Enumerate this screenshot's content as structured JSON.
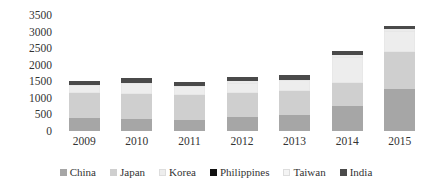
{
  "chart_data": {
    "type": "bar",
    "stacked": true,
    "title": "",
    "subtitle": "",
    "xlabel": "",
    "ylabel": "",
    "categories": [
      "2009",
      "2010",
      "2011",
      "2012",
      "2013",
      "2014",
      "2015"
    ],
    "ylim": [
      0,
      3500
    ],
    "yticks": [
      0,
      500,
      1000,
      1500,
      2000,
      2500,
      3000,
      3500
    ],
    "ytick_labels": [
      "0",
      "500",
      "1000",
      "1500",
      "2000",
      "2500",
      "3000",
      "3500"
    ],
    "grid": false,
    "legend_position": "bottom",
    "series": [
      {
        "name": "China",
        "color": "#a6a6a6",
        "values": [
          390,
          360,
          330,
          420,
          480,
          760,
          1270
        ]
      },
      {
        "name": "Japan",
        "color": "#cfcfcf",
        "values": [
          760,
          760,
          760,
          720,
          720,
          700,
          1110
        ]
      },
      {
        "name": "Korea",
        "color": "#ededed",
        "values": [
          230,
          340,
          270,
          300,
          340,
          760,
          630
        ]
      },
      {
        "name": "Philippines",
        "color": "#111111",
        "values": [
          0,
          0,
          0,
          0,
          0,
          0,
          0
        ]
      },
      {
        "name": "Taiwan",
        "color": "#f4f4f4",
        "values": [
          0,
          0,
          0,
          60,
          0,
          60,
          60
        ]
      },
      {
        "name": "India",
        "color": "#4a4a4a",
        "values": [
          120,
          140,
          120,
          120,
          140,
          120,
          110
        ]
      }
    ],
    "totals": [
      1500,
      1600,
      1480,
      1620,
      1680,
      2400,
      3180
    ]
  },
  "legend": {
    "items": [
      {
        "label": "China",
        "swatch": "#a6a6a6"
      },
      {
        "label": "Japan",
        "swatch": "#cfcfcf"
      },
      {
        "label": "Korea",
        "swatch": "#ededed"
      },
      {
        "label": "Philippines",
        "swatch": "#111111"
      },
      {
        "label": "Taiwan",
        "swatch": "#f4f4f4"
      },
      {
        "label": "India",
        "swatch": "#4a4a4a"
      }
    ]
  }
}
